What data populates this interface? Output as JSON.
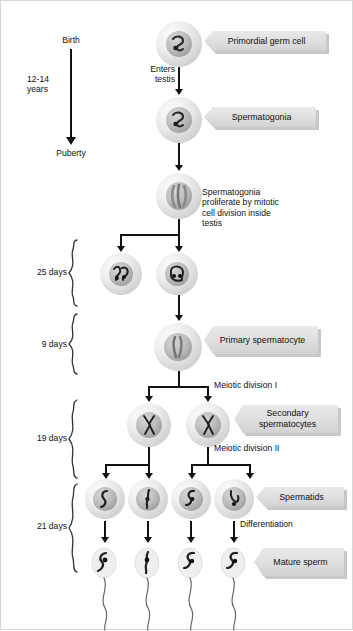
{
  "diagram": {
    "timeline": {
      "start_label": "Birth",
      "end_label": "Puberty",
      "duration_label": "12-14\nyears"
    },
    "stage_durations": [
      {
        "id": "mitosis",
        "label": "25 days"
      },
      {
        "id": "meiosis-i",
        "label": "9 days"
      },
      {
        "id": "meiosis-ii",
        "label": "19 days"
      },
      {
        "id": "spermiogenesis",
        "label": "21 days"
      }
    ],
    "callouts": [
      {
        "id": "primordial-germ-cell",
        "label": "Primordial germ cell"
      },
      {
        "id": "spermatogonia",
        "label": "Spermatogonia"
      },
      {
        "id": "primary-spermatocyte",
        "label": "Primary\nspermatocyte"
      },
      {
        "id": "secondary-spermatocytes",
        "label": "Secondary\nspermatocytes"
      },
      {
        "id": "spermatids",
        "label": "Spermatids"
      },
      {
        "id": "mature-sperm",
        "label": "Mature\nsperm"
      }
    ],
    "annotations": [
      {
        "id": "enters-testis",
        "label": "Enters\ntestis"
      },
      {
        "id": "mitotic-proliferation",
        "label": "Spermatogonia\nproliferate by mitotic\ncell division inside\ntestis"
      },
      {
        "id": "meiotic-division-1",
        "label": "Meiotic division I"
      },
      {
        "id": "meiotic-division-2",
        "label": "Meiotic division II"
      },
      {
        "id": "differentiation",
        "label": "Differentiation"
      }
    ],
    "colors": {
      "background": "#ffffff",
      "text": "#111111",
      "callout_fill": "#e0e0e0",
      "callout_shadow": "#9a9a9a",
      "arrow": "#111111",
      "cell_fill": "#e8e8e8",
      "nucleus_fill": "#b0b0b0"
    }
  }
}
